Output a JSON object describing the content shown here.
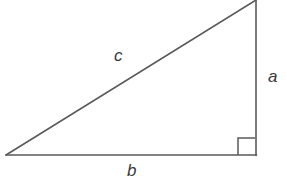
{
  "figure": {
    "kind": "right-triangle-diagram",
    "background_color": "#ffffff",
    "stroke_color": "#5a5a5a",
    "label_color": "#3a3a3a",
    "stroke_width": 1.6
  },
  "geometry": {
    "vertices": {
      "left": {
        "x": 6,
        "y": 155
      },
      "bottom_right": {
        "x": 256,
        "y": 155
      },
      "top_right": {
        "x": 256,
        "y": 0
      }
    },
    "right_angle_marker": {
      "x": 238,
      "y": 138,
      "size": 17,
      "at_vertex": "bottom-right"
    }
  },
  "labels": {
    "hypotenuse": "c",
    "vertical_leg": "a",
    "horizontal_leg": "b"
  }
}
